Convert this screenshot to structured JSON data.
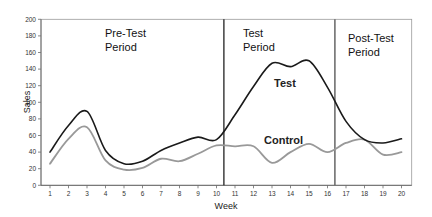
{
  "chart_data": {
    "type": "line",
    "title": "",
    "xlabel": "Week",
    "ylabel": "Sales",
    "ylim": [
      0,
      200
    ],
    "yticks": [
      0,
      20,
      40,
      60,
      80,
      100,
      120,
      140,
      160,
      180,
      200
    ],
    "x": [
      1,
      2,
      3,
      4,
      5,
      6,
      7,
      8,
      9,
      10,
      11,
      12,
      13,
      14,
      15,
      16,
      17,
      18,
      19,
      20
    ],
    "xlim": [
      1,
      20
    ],
    "grid": false,
    "legend": "none (inline labels)",
    "series": [
      {
        "name": "Test",
        "color": "#1a1a1a",
        "values": [
          40,
          72,
          89,
          42,
          26,
          29,
          42,
          51,
          58,
          55,
          85,
          119,
          147,
          143,
          150,
          118,
          77,
          55,
          51,
          56
        ]
      },
      {
        "name": "Control",
        "color": "#999999",
        "values": [
          26,
          56,
          70,
          30,
          19,
          21,
          32,
          29,
          38,
          48,
          47,
          47,
          27,
          40,
          50,
          40,
          51,
          55,
          37,
          40
        ]
      }
    ],
    "annotations": [
      {
        "text": "Pre-Test\nPeriod",
        "region": [
          1,
          10.4
        ]
      },
      {
        "text": "Test\nPeriod",
        "region": [
          10.4,
          16.4
        ]
      },
      {
        "text": "Post-Test\nPeriod",
        "region": [
          16.4,
          20
        ]
      },
      {
        "text": "Test",
        "series_label": true,
        "x": 13.8,
        "y": 124
      },
      {
        "text": "Control",
        "series_label": true,
        "x": 13.4,
        "y": 55
      }
    ],
    "dividers": [
      {
        "x": 10.4,
        "color": "#111111"
      },
      {
        "x": 16.4,
        "color": "#666666"
      }
    ]
  },
  "labels": {
    "xlabel": "Week",
    "ylabel": "Sales",
    "pre_test_line1": "Pre-Test",
    "pre_test_line2": "Period",
    "test_line1": "Test",
    "test_line2": "Period",
    "post_test_line1": "Post-Test",
    "post_test_line2": "Period",
    "series_test": "Test",
    "series_control": "Control"
  }
}
